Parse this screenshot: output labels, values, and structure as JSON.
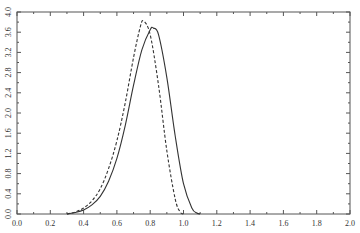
{
  "chart_data": {
    "type": "line",
    "title": "",
    "xlabel": "",
    "ylabel": "",
    "xlim": [
      0.0,
      2.0
    ],
    "ylim": [
      0.0,
      4.0
    ],
    "grid": false,
    "legend": null,
    "x_ticks": [
      "0.0",
      "0.2",
      "0.4",
      "0.6",
      "0.8",
      "1.0",
      "1.2",
      "1.4",
      "1.6",
      "1.8",
      "2.0"
    ],
    "y_ticks": [
      "0.0",
      "0.4",
      "0.8",
      "1.2",
      "1.6",
      "2.0",
      "2.4",
      "2.8",
      "3.2",
      "3.6",
      "4.0"
    ],
    "series": [
      {
        "name": "solid",
        "style": "solid",
        "color": "#333333",
        "x": [
          0.3,
          0.35,
          0.4,
          0.45,
          0.5,
          0.55,
          0.6,
          0.65,
          0.7,
          0.75,
          0.8,
          0.82,
          0.85,
          0.9,
          0.95,
          1.0,
          1.05,
          1.08,
          1.1
        ],
        "y": [
          0.0,
          0.03,
          0.08,
          0.18,
          0.35,
          0.65,
          1.1,
          1.75,
          2.55,
          3.25,
          3.65,
          3.68,
          3.55,
          2.7,
          1.55,
          0.6,
          0.12,
          0.02,
          0.0
        ]
      },
      {
        "name": "dashed",
        "style": "dashed",
        "color": "#333333",
        "x": [
          0.3,
          0.35,
          0.4,
          0.45,
          0.5,
          0.55,
          0.6,
          0.65,
          0.7,
          0.74,
          0.76,
          0.8,
          0.85,
          0.9,
          0.95,
          0.98,
          1.0
        ],
        "y": [
          0.0,
          0.04,
          0.12,
          0.26,
          0.5,
          0.9,
          1.45,
          2.2,
          3.1,
          3.7,
          3.82,
          3.55,
          2.55,
          1.25,
          0.3,
          0.04,
          0.0
        ]
      }
    ]
  }
}
